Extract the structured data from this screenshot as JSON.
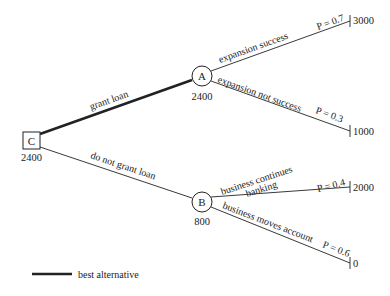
{
  "diagram": {
    "type": "decision-tree",
    "decision_node": {
      "label": "C",
      "value": "2400"
    },
    "chance_nodes": [
      {
        "id": "A",
        "label": "A",
        "value": "2400"
      },
      {
        "id": "B",
        "label": "B",
        "value": "800"
      }
    ],
    "branches": [
      {
        "from": "C",
        "to": "A",
        "label": "grant loan",
        "best": true
      },
      {
        "from": "C",
        "to": "B",
        "label": "do not grant loan",
        "best": false
      }
    ],
    "outcomes": [
      {
        "from": "A",
        "label": "expansion success",
        "probability": "P = 0.7",
        "payoff": "3000"
      },
      {
        "from": "A",
        "label": "expansion not success",
        "probability": "P = 0.3",
        "payoff": "1000"
      },
      {
        "from": "B",
        "label": "business continues",
        "label2": "banking",
        "probability": "P = 0.4",
        "payoff": "2000"
      },
      {
        "from": "B",
        "label": "business moves account",
        "probability": "P = 0.6",
        "payoff": "0"
      }
    ],
    "legend": {
      "label": "best alternative"
    },
    "colors": {
      "line": "#222222",
      "background": "#ffffff"
    }
  }
}
